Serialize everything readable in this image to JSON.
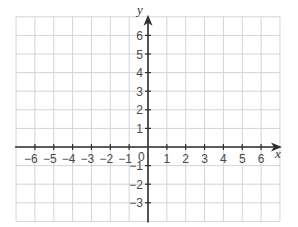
{
  "chart_data": {
    "type": "coordinate-grid",
    "title": "",
    "xlabel": "x",
    "ylabel": "y",
    "xlim": [
      -7,
      7
    ],
    "ylim": [
      -4,
      7
    ],
    "grid": true,
    "x_ticks": [
      -6,
      -5,
      -4,
      -3,
      -2,
      -1,
      1,
      2,
      3,
      4,
      5,
      6
    ],
    "y_ticks": [
      -3,
      -2,
      -1,
      1,
      2,
      3,
      4,
      5,
      6
    ],
    "origin_label": "0",
    "x_tick_labels": [
      "−6",
      "−5",
      "−4",
      "−3",
      "−2",
      "−1",
      "1",
      "2",
      "3",
      "4",
      "5",
      "6"
    ],
    "y_tick_labels": [
      "−3",
      "−2",
      "−1",
      "1",
      "2",
      "3",
      "4",
      "5",
      "6"
    ]
  },
  "colors": {
    "grid": "#d4d4d4",
    "axis": "#2e2e2e",
    "label": "#4a4a4a"
  }
}
